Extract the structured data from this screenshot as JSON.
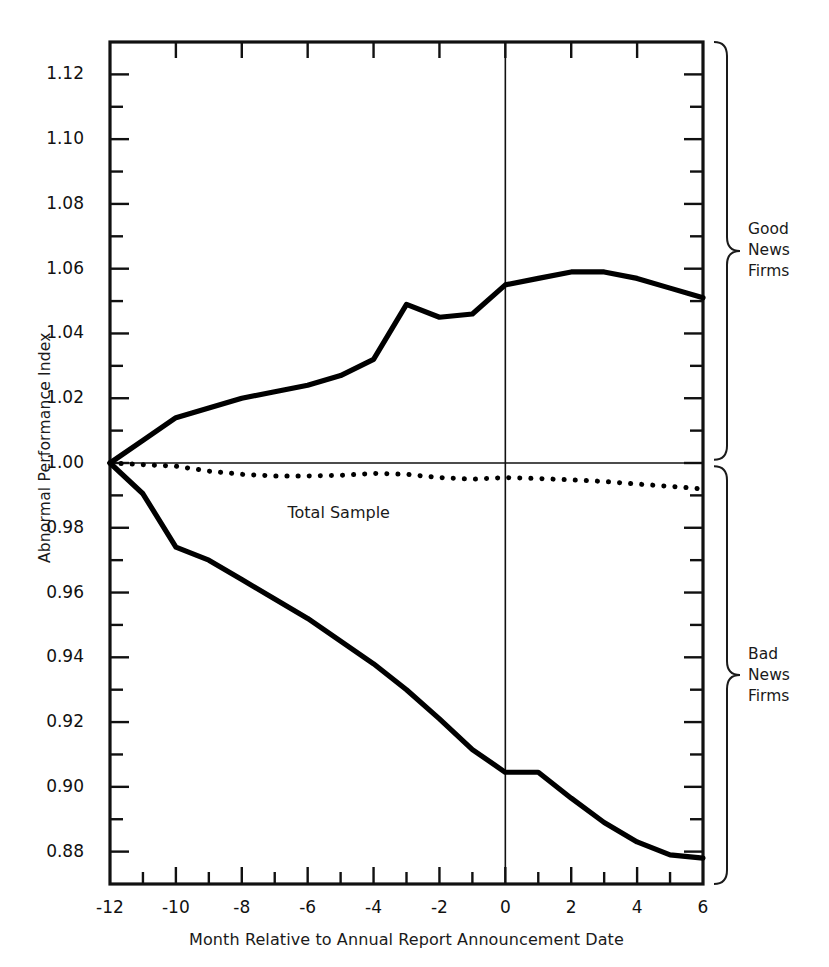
{
  "chart_data": {
    "type": "line",
    "title": "",
    "xlabel": "Month Relative to Annual Report Announcement Date",
    "ylabel": "Abnormal Performance Index",
    "xlim": [
      -12,
      6
    ],
    "ylim": [
      0.87,
      1.13
    ],
    "grid": false,
    "legend_position": "inline-annotations",
    "x_ticks_major": [
      -12,
      -10,
      -8,
      -6,
      -4,
      -2,
      0,
      2,
      4,
      6
    ],
    "x_tick_labels": [
      "-12",
      "-10",
      "-8",
      "-6",
      "-4",
      "-2",
      "0",
      "2",
      "4",
      "6"
    ],
    "x_ticks_minor_step": 1,
    "y_ticks_major": [
      0.88,
      0.9,
      0.92,
      0.94,
      0.96,
      0.98,
      1.0,
      1.02,
      1.04,
      1.06,
      1.08,
      1.1,
      1.12
    ],
    "y_tick_labels": [
      "0.88",
      "0.90",
      "0.92",
      "0.94",
      "0.96",
      "0.98",
      "1.00",
      "1.02",
      "1.04",
      "1.06",
      "1.08",
      "1.10",
      "1.12"
    ],
    "y_ticks_minor_step": 0.01,
    "reference_line_y": 1.0,
    "reference_line_x": 0,
    "x": [
      -12,
      -11,
      -10,
      -9,
      -8,
      -7,
      -6,
      -5,
      -4,
      -3,
      -2,
      -1,
      0,
      1,
      2,
      3,
      4,
      5,
      6
    ],
    "series": [
      {
        "name": "Good News Firms",
        "style": "solid-thick",
        "color": "#000000",
        "values": [
          1.0,
          1.007,
          1.014,
          1.017,
          1.02,
          1.022,
          1.024,
          1.027,
          1.032,
          1.049,
          1.045,
          1.046,
          1.055,
          1.057,
          1.059,
          1.059,
          1.057,
          1.054,
          1.051
        ]
      },
      {
        "name": "Total Sample",
        "style": "dotted",
        "color": "#000000",
        "values": [
          1.0,
          0.9995,
          0.999,
          0.9975,
          0.9965,
          0.996,
          0.996,
          0.9962,
          0.9968,
          0.9965,
          0.9955,
          0.995,
          0.9955,
          0.9952,
          0.9948,
          0.9943,
          0.9935,
          0.9928,
          0.992
        ]
      },
      {
        "name": "Bad News Firms",
        "style": "solid-thick",
        "color": "#000000",
        "values": [
          1.0,
          0.9905,
          0.974,
          0.97,
          0.964,
          0.958,
          0.952,
          0.945,
          0.938,
          0.93,
          0.921,
          0.9115,
          0.9045,
          0.9045,
          0.8965,
          0.889,
          0.883,
          0.879,
          0.878
        ]
      }
    ],
    "annotations": [
      {
        "text": "Total Sample",
        "x": -5.3,
        "y": 0.9895,
        "name": "total-sample-annotation"
      }
    ],
    "braces": [
      {
        "label_lines": [
          "Good",
          "News",
          "Firms"
        ],
        "from_y": 1.13,
        "to_y": 1.001,
        "name": "good-news-firms-brace"
      },
      {
        "label_lines": [
          "Bad",
          "News",
          "Firms"
        ],
        "from_y": 0.999,
        "to_y": 0.87,
        "name": "bad-news-firms-brace"
      }
    ]
  },
  "colors": {
    "background": "#ffffff",
    "foreground": "#1a1a1a",
    "axis": "#111111",
    "line": "#000000"
  }
}
